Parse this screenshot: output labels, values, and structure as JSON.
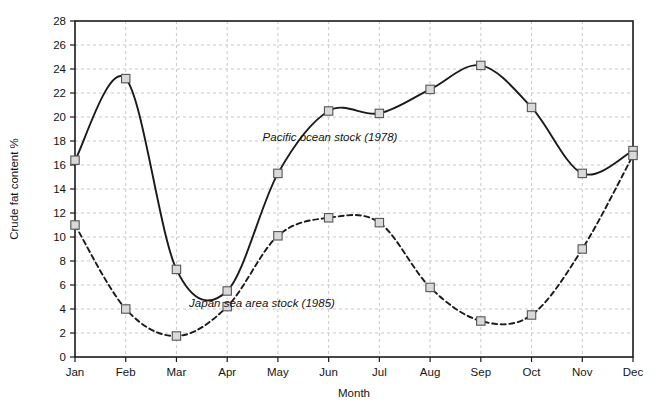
{
  "chart_data": {
    "type": "line",
    "title": "",
    "xlabel": "Month",
    "ylabel": "Crude fat content %",
    "categories": [
      "Jan",
      "Feb",
      "Mar",
      "Apr",
      "May",
      "Jun",
      "Jul",
      "Aug",
      "Sep",
      "Oct",
      "Nov",
      "Dec"
    ],
    "ylim": [
      0,
      28
    ],
    "ytick_step": 2,
    "yticks": [
      0,
      2,
      4,
      6,
      8,
      10,
      12,
      14,
      16,
      18,
      20,
      22,
      24,
      26,
      28
    ],
    "grid": true,
    "grid_style": "dashed",
    "legend_position": "inline-annotation",
    "series": [
      {
        "name": "Pacific ocean stock (1978)",
        "line_style": "solid",
        "marker": "square",
        "color": "#1a1a1a",
        "values": [
          16.4,
          23.2,
          7.3,
          5.5,
          15.3,
          20.5,
          20.3,
          22.3,
          24.3,
          20.8,
          15.3,
          17.2
        ]
      },
      {
        "name": "Japan sea area stock (1985)",
        "line_style": "dashed",
        "marker": "square",
        "color": "#1a1a1a",
        "values": [
          11.0,
          4.0,
          1.75,
          4.2,
          10.1,
          11.6,
          11.2,
          5.8,
          3.0,
          3.5,
          9.0,
          16.8
        ]
      }
    ],
    "annotations": [
      {
        "text": "Pacific ocean stock (1978)",
        "x_px": 330,
        "y_px": 141
      },
      {
        "text": "Japan sea area stock (1985)",
        "x_px": 262,
        "y_px": 307
      }
    ]
  },
  "colors": {
    "axis": "#1a1a1a",
    "grid": "#c9c9c9",
    "marker_fill": "#d9d9d9",
    "marker_stroke": "#555555",
    "background": "#ffffff"
  }
}
